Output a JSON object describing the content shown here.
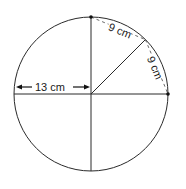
{
  "diagram": {
    "type": "circle-geometry",
    "center": {
      "x": 91,
      "y": 94
    },
    "radius_px": 77,
    "stroke_color": "#2a2a2a",
    "labels": {
      "radius": "13 cm",
      "chord_upper": "9 cm",
      "chord_lower": "9 cm"
    },
    "points": [
      {
        "name": "top-point",
        "x": 91,
        "y": 17
      },
      {
        "name": "right-point",
        "x": 168,
        "y": 94
      }
    ]
  }
}
